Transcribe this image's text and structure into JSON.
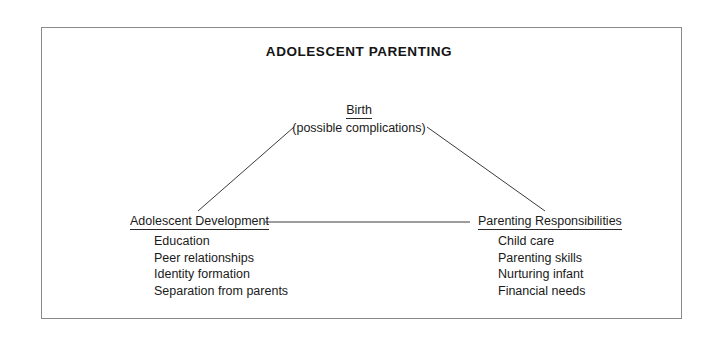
{
  "diagram": {
    "title": "ADOLESCENT PARENTING",
    "root": {
      "label": "Birth",
      "sublabel": "(possible complications)"
    },
    "branches": [
      {
        "label": "Adolescent Development",
        "items": [
          "Education",
          "Peer relationships",
          "Identity formation",
          "Separation from parents"
        ]
      },
      {
        "label": "Parenting Responsibilities",
        "items": [
          "Child care",
          "Parenting skills",
          "Nurturing infant",
          "Financial needs"
        ]
      }
    ],
    "connectors": [
      {
        "name": "birth-to-adolescent-development",
        "x1": 294,
        "y1": 127,
        "x2": 198,
        "y2": 211
      },
      {
        "name": "birth-to-parenting-responsibilities",
        "x1": 427,
        "y1": 127,
        "x2": 545,
        "y2": 211
      },
      {
        "name": "adolescent-development-to-parenting-responsibilities",
        "x1": 265,
        "y1": 222,
        "x2": 470,
        "y2": 222
      }
    ],
    "colors": {
      "line": "#3a3a3a",
      "border": "#8a8a8a",
      "text": "#1a1a1a",
      "background": "#ffffff"
    }
  }
}
